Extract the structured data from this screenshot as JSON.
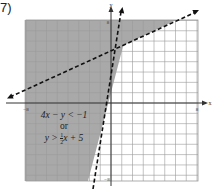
{
  "problem": {
    "number": "7)"
  },
  "inequality": {
    "line1": "4x − y < −1",
    "connector": "or",
    "line2_prefix": "y > ",
    "line2_frac_num": "1",
    "line2_frac_den": "2",
    "line2_suffix": "x + 5"
  },
  "axes": {
    "x_label": "x",
    "y_label": "y",
    "x_min_label": "−8",
    "x_max_label": "8",
    "y_max_label": "8",
    "y_min_label": "−8"
  },
  "colors": {
    "shade": "#a9a9a9",
    "grid_on_shade": "#8a8a8a",
    "grid": "#9a9a9a",
    "axis": "#333333",
    "line": "#111111"
  },
  "chart_data": {
    "type": "line",
    "xlabel": "x",
    "ylabel": "y",
    "xlim": [
      -8,
      8
    ],
    "ylim": [
      -8,
      8
    ],
    "grid": true,
    "series": [
      {
        "name": "4x − y = −1 (y = 4x + 1)",
        "style": "dashed",
        "slope": 4,
        "intercept": 1,
        "points": [
          [
            -2,
            -7
          ],
          [
            1.75,
            8
          ]
        ]
      },
      {
        "name": "y = (1/2)x + 5",
        "style": "dashed",
        "slope": 0.5,
        "intercept": 5,
        "points": [
          [
            -8,
            1
          ],
          [
            6,
            8
          ]
        ]
      }
    ],
    "shaded_region": "union: y > 4x + 1 OR y > 0.5x + 5",
    "intersection": [
      1.14,
      5.57
    ]
  }
}
